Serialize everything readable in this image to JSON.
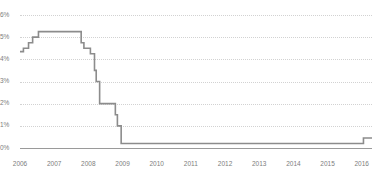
{
  "chart_data": {
    "type": "line",
    "title": "",
    "subtitle": "",
    "xlabel": "",
    "ylabel": "",
    "grid": true,
    "legend_position": "none",
    "series_color": "#8c8c8c",
    "gridline_color": "#d2d2d2",
    "axis_color": "#9a9a9a",
    "tick_label_color": "#7d7d7d",
    "xlim": [
      2006.0,
      2016.3
    ],
    "ylim": [
      0,
      6
    ],
    "y_ticks": [
      0,
      1,
      2,
      3,
      4,
      5,
      6
    ],
    "y_tick_labels": [
      "0%",
      "1%",
      "2%",
      "3%",
      "4%",
      "5%",
      "6%"
    ],
    "x_ticks": [
      2006,
      2007,
      2008,
      2009,
      2010,
      2011,
      2012,
      2013,
      2014,
      2015,
      2016
    ],
    "x_tick_labels": [
      "2006",
      "2007",
      "2008",
      "2009",
      "2010",
      "2011",
      "2012",
      "2013",
      "2014",
      "2015",
      "2016"
    ],
    "series": [
      {
        "name": "Rate",
        "step": "post",
        "x": [
          2006.0,
          2006.1,
          2006.25,
          2006.37,
          2006.54,
          2007.0,
          2007.62,
          2007.79,
          2007.87,
          2008.06,
          2008.18,
          2008.23,
          2008.33,
          2008.62,
          2008.79,
          2008.85,
          2008.96,
          2015.96,
          2016.05,
          2016.3
        ],
        "y": [
          4.35,
          4.5,
          4.75,
          5.0,
          5.25,
          5.25,
          5.25,
          4.75,
          4.5,
          4.25,
          3.5,
          3.0,
          2.0,
          2.0,
          1.5,
          1.0,
          0.2,
          0.2,
          0.45,
          0.45
        ]
      }
    ],
    "annotations": [
      {
        "text": "plateau at 5.25% through mid-2007"
      },
      {
        "text": "stepped cuts late 2007 through 2008"
      },
      {
        "text": "near-zero floor 2009 to 2015"
      },
      {
        "text": "small uptick at end of 2015"
      }
    ]
  }
}
